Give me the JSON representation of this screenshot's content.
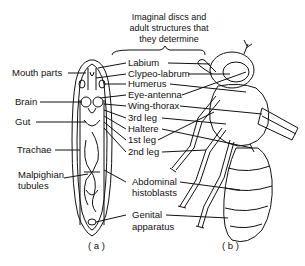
{
  "header": {
    "line1": "Imaginal discs and",
    "line2": "adult structures that",
    "line3": "they determine"
  },
  "left_labels": {
    "mouth_parts": "Mouth parts",
    "brain": "Brain",
    "gut": "Gut",
    "trachae": "Trachae",
    "malpighian_1": "Malpighian",
    "malpighian_2": "tubules"
  },
  "center_labels": {
    "labium": "Labium",
    "clypeo_labrum": "Clypeo-labrum",
    "humerus": "Humerus",
    "eye_antenna": "Eye-antenna",
    "wing_thorax": "Wing-thorax",
    "third_leg": "3rd leg",
    "haltere": "Haltere",
    "first_leg": "1st leg",
    "second_leg": "2nd leg",
    "abdominal_1": "Abdominal",
    "abdominal_2": "histoblasts",
    "genital_1": "Genital",
    "genital_2": "apparatus"
  },
  "captions": {
    "a": "( a )",
    "b": "( b )"
  }
}
